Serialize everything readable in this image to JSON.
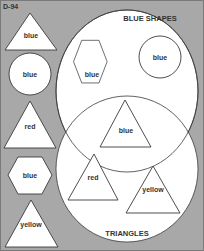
{
  "worksheet": {
    "code": "D-94",
    "background_color": "#a8a8a8",
    "shape_fill": "#ffffff",
    "stroke_color": "#3a3a3a"
  },
  "venn": {
    "sets": [
      {
        "label": "BLUE SHAPES"
      },
      {
        "label": "TRIANGLES"
      }
    ],
    "regions": {
      "blue_only": [
        {
          "shape": "hexagon",
          "label": "blue"
        },
        {
          "shape": "circle",
          "label": "blue"
        }
      ],
      "intersection": [
        {
          "shape": "triangle",
          "label": "blue"
        }
      ],
      "triangles_only": [
        {
          "shape": "triangle",
          "label": "red"
        },
        {
          "shape": "triangle",
          "label": "yellow"
        }
      ]
    }
  },
  "palette": {
    "items": [
      {
        "shape": "triangle",
        "label": "blue"
      },
      {
        "shape": "circle",
        "label": "blue"
      },
      {
        "shape": "triangle",
        "label": "red"
      },
      {
        "shape": "hexagon",
        "label": "blue"
      },
      {
        "shape": "triangle",
        "label": "yellow"
      }
    ]
  }
}
